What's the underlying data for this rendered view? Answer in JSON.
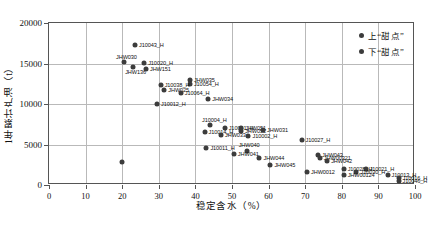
{
  "chart_data": {
    "type": "scatter",
    "title": "",
    "xlabel": "稳定含水（%）",
    "ylabel": "1年累计产油（t）",
    "xlim": [
      0,
      100
    ],
    "ylim": [
      0,
      20000
    ],
    "xticks": [
      0,
      10,
      20,
      30,
      40,
      50,
      60,
      70,
      80,
      90,
      100
    ],
    "yticks": [
      0,
      5000,
      10000,
      15000,
      20000
    ],
    "grid": true,
    "legend_position": "top-right",
    "series": [
      {
        "name": "上“甜点”",
        "color": "#3c3c3c",
        "points": [
          {
            "label": "J10043_H",
            "x": 23.5,
            "y": 17300,
            "lx": "right"
          },
          {
            "label": "JHW030",
            "x": 20.5,
            "y": 15150,
            "lx": "above"
          },
          {
            "label": "J10020_H",
            "x": 26.0,
            "y": 15050,
            "lx": "right"
          },
          {
            "label": "JHW136",
            "x": 23.0,
            "y": 14600,
            "lx": "below"
          },
          {
            "label": "JHW151",
            "x": 26.5,
            "y": 14350,
            "lx": "right"
          },
          {
            "label": "JHW035",
            "x": 38.5,
            "y": 13000,
            "lx": "right"
          },
          {
            "label": "J10054_H",
            "x": 38.5,
            "y": 12450,
            "lx": "right"
          },
          {
            "label": "J10038_H",
            "x": 30.5,
            "y": 12300,
            "lx": "right"
          },
          {
            "label": "JHW025",
            "x": 31.5,
            "y": 11700,
            "lx": "right"
          },
          {
            "label": "J10064_H",
            "x": 36.0,
            "y": 11300,
            "lx": "right"
          },
          {
            "label": "J10012_H",
            "x": 29.5,
            "y": 10000,
            "lx": "right"
          },
          {
            "label": "JHW034",
            "x": 43.5,
            "y": 10600,
            "lx": "right"
          },
          {
            "label": "J10004_H",
            "x": 44.0,
            "y": 7400,
            "lx": "above"
          },
          {
            "label": "J10041_H",
            "x": 48.0,
            "y": 7050,
            "lx": "right"
          },
          {
            "label": "J10014_H",
            "x": 42.5,
            "y": 6550,
            "lx": "right"
          },
          {
            "label": "JHW051",
            "x": 52.5,
            "y": 7050,
            "lx": "right"
          },
          {
            "label": "JHW052",
            "x": 52.5,
            "y": 6700,
            "lx": "right"
          },
          {
            "label": "JHW031",
            "x": 58.5,
            "y": 6750,
            "lx": "right"
          },
          {
            "label": "JHW033",
            "x": 47.0,
            "y": 6150,
            "lx": "right"
          },
          {
            "label": "J10002_H",
            "x": 54.5,
            "y": 6050,
            "lx": "right"
          },
          {
            "label": "J10027_H",
            "x": 69.0,
            "y": 5600,
            "lx": "right"
          }
        ]
      },
      {
        "name": "下“甜点”",
        "color": "#3c3c3c",
        "points": [
          {
            "label": "",
            "x": 20.0,
            "y": 2900,
            "lx": "none"
          },
          {
            "label": "J10011_H",
            "x": 43.0,
            "y": 4600,
            "lx": "right"
          },
          {
            "label": "JHW040",
            "x": 54.0,
            "y": 4200,
            "lx": "above"
          },
          {
            "label": "JHW041",
            "x": 50.5,
            "y": 3800,
            "lx": "right"
          },
          {
            "label": "JHW044",
            "x": 57.5,
            "y": 3300,
            "lx": "right"
          },
          {
            "label": "JHW045",
            "x": 60.5,
            "y": 2450,
            "lx": "right"
          },
          {
            "label": "JHW043",
            "x": 73.5,
            "y": 3750,
            "lx": "right"
          },
          {
            "label": "JHW00321",
            "x": 74.0,
            "y": 3350,
            "lx": "right"
          },
          {
            "label": "JHW042",
            "x": 76.0,
            "y": 2950,
            "lx": "right"
          },
          {
            "label": "JHW0012",
            "x": 70.5,
            "y": 1600,
            "lx": "right"
          },
          {
            "label": "J10028_H",
            "x": 80.5,
            "y": 2000,
            "lx": "right"
          },
          {
            "label": "J10021_H",
            "x": 86.5,
            "y": 2000,
            "lx": "right"
          },
          {
            "label": "J10030_H",
            "x": 84.0,
            "y": 1600,
            "lx": "right"
          },
          {
            "label": "JHW00124",
            "x": 80.5,
            "y": 1200,
            "lx": "right"
          },
          {
            "label": "J10013_H",
            "x": 92.5,
            "y": 1200,
            "lx": "right"
          },
          {
            "label": "J10016_H",
            "x": 95.5,
            "y": 850,
            "lx": "right"
          },
          {
            "label": "J10046_H",
            "x": 95.5,
            "y": 500,
            "lx": "right"
          }
        ]
      }
    ],
    "legend": [
      {
        "label": "上“甜点”",
        "color": "#3c3c3c"
      },
      {
        "label": "下“甜点”",
        "color": "#3c3c3c"
      }
    ]
  }
}
